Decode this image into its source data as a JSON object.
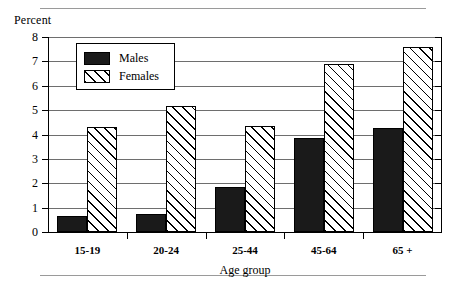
{
  "chart_data": {
    "type": "bar",
    "title": "",
    "ylabel": "Percent",
    "xlabel": "Age group",
    "categories": [
      "15-19",
      "20-24",
      "25-44",
      "45-64",
      "65 +"
    ],
    "series": [
      {
        "name": "Males",
        "values": [
          0.65,
          0.75,
          1.85,
          3.85,
          4.25
        ]
      },
      {
        "name": "Females",
        "values": [
          4.3,
          5.15,
          4.35,
          6.9,
          7.6
        ]
      }
    ],
    "ylim": [
      0,
      8
    ],
    "yticks": [
      "0",
      "1",
      "2",
      "3",
      "4",
      "5",
      "6",
      "7",
      "8"
    ],
    "grid": true,
    "legend_position": "top-left-inside",
    "colors": {
      "males": "#1a1a1a",
      "females": "#ffffff",
      "axis": "#000000",
      "gridline": "#6e6e6e",
      "rule": "#9a9a9a"
    }
  },
  "figure": {
    "y_axis_caption": "Percent",
    "x_axis_caption": "Age group"
  },
  "legend": {
    "items": [
      {
        "label": "Males",
        "swatch": "solid-black-swatch"
      },
      {
        "label": "Females",
        "swatch": "diagonal-hatch-swatch"
      }
    ]
  }
}
